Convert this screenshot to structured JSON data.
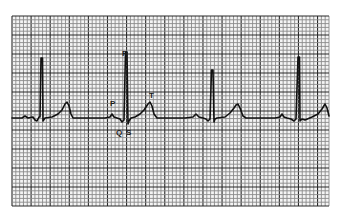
{
  "figure": {
    "type": "ecg-strip",
    "grid": {
      "x": 12,
      "y": 16,
      "width": 317,
      "height": 190,
      "minor_cell": 3.8,
      "major_every": 5,
      "minor_color": "#8a8a8a",
      "major_color": "#2a2a2a",
      "background": "#f4f4f4"
    },
    "trace": {
      "color": "#111111",
      "baseline_y": 118
    },
    "labels": {
      "r": "R",
      "p": "P",
      "t": "T",
      "q": "Q",
      "s": "S"
    }
  }
}
